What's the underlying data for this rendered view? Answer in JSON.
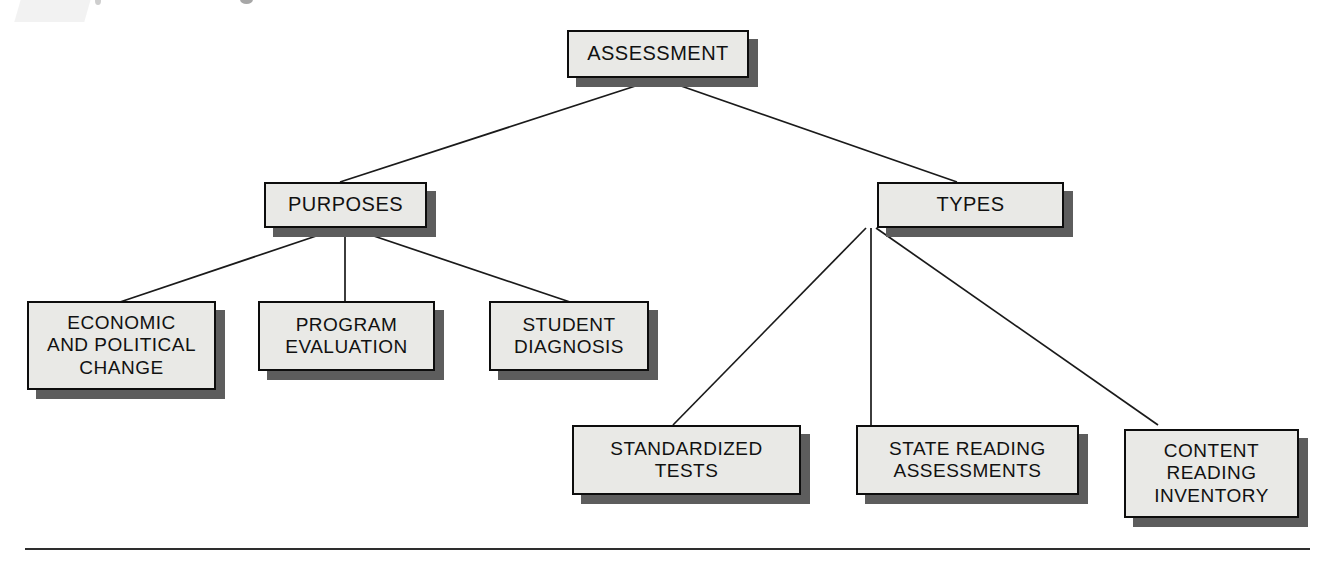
{
  "diagram": {
    "type": "hierarchy-tree",
    "title": "ASSESSMENT",
    "root": {
      "id": "assessment",
      "label": "ASSESSMENT"
    },
    "branches": [
      {
        "id": "purposes",
        "label": "PURPOSES",
        "children": [
          {
            "id": "economic-and-political-change",
            "label": "ECONOMIC\nAND POLITICAL\nCHANGE"
          },
          {
            "id": "program-evaluation",
            "label": "PROGRAM\nEVALUATION"
          },
          {
            "id": "student-diagnosis",
            "label": "STUDENT\nDIAGNOSIS"
          }
        ]
      },
      {
        "id": "types",
        "label": "TYPES",
        "children": [
          {
            "id": "standardized-tests",
            "label": "STANDARDIZED\nTESTS"
          },
          {
            "id": "state-reading-assessments",
            "label": "STATE READING\nASSESSMENTS"
          },
          {
            "id": "content-reading-inventory",
            "label": "CONTENT\nREADING\nINVENTORY"
          }
        ]
      }
    ],
    "colors": {
      "box_fill": "#e9e9e6",
      "box_border": "#0d0d0d",
      "box_shadow": "#5d5d5d",
      "connector": "#1a1a1a",
      "rule": "#2e2e2e",
      "text": "#111111"
    }
  }
}
